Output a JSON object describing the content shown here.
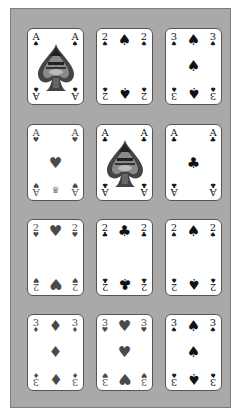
{
  "table": {
    "background_color": "#a9a9a9",
    "rows": 4,
    "columns": 3
  },
  "suit_glyphs": {
    "spades": "♠",
    "hearts": "♥",
    "diamonds": "♦",
    "clubs": "♣"
  },
  "cards": [
    {
      "row": 1,
      "col": 1,
      "rank": "A",
      "suit": "spades",
      "suit_glyph": "♠",
      "color": "black",
      "style": "ornate-ace"
    },
    {
      "row": 1,
      "col": 2,
      "rank": "2",
      "suit": "spades",
      "suit_glyph": "♠",
      "color": "black"
    },
    {
      "row": 1,
      "col": 3,
      "rank": "3",
      "suit": "spades",
      "suit_glyph": "♠",
      "color": "black"
    },
    {
      "row": 2,
      "col": 1,
      "rank": "A",
      "suit": "hearts",
      "suit_glyph": "♥",
      "color": "red",
      "emblem": "♛"
    },
    {
      "row": 2,
      "col": 2,
      "rank": "A",
      "suit": "clubs",
      "suit_glyph": "♣",
      "color": "black",
      "style": "ornate-ace"
    },
    {
      "row": 2,
      "col": 3,
      "rank": "A",
      "suit": "clubs",
      "suit_glyph": "♣",
      "color": "black"
    },
    {
      "row": 3,
      "col": 1,
      "rank": "2",
      "suit": "hearts",
      "suit_glyph": "♥",
      "color": "red"
    },
    {
      "row": 3,
      "col": 2,
      "rank": "2",
      "suit": "clubs",
      "suit_glyph": "♣",
      "color": "black"
    },
    {
      "row": 3,
      "col": 3,
      "rank": "2",
      "suit": "spades",
      "suit_glyph": "♠",
      "color": "black"
    },
    {
      "row": 4,
      "col": 1,
      "rank": "3",
      "suit": "diamonds",
      "suit_glyph": "♦",
      "color": "red"
    },
    {
      "row": 4,
      "col": 2,
      "rank": "3",
      "suit": "hearts",
      "suit_glyph": "♥",
      "color": "red"
    },
    {
      "row": 4,
      "col": 3,
      "rank": "3",
      "suit": "spades",
      "suit_glyph": "♠",
      "color": "black"
    }
  ]
}
